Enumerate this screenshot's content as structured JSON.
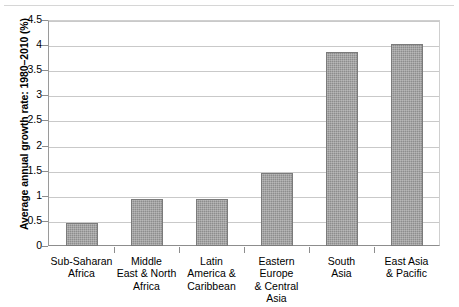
{
  "chart_data": {
    "type": "bar",
    "title": "",
    "subtitle": "",
    "xlabel": "",
    "ylabel": "Average annual growth rate: 1980–2010 (%)",
    "categories": [
      "Sub-Saharan\nAfrica",
      "Middle\nEast & North\nAfrica",
      "Latin\nAmerica &\nCaribbean",
      "Eastern\nEurope\n& Central\nAsia",
      "South\nAsia",
      "East Asia\n& Pacific"
    ],
    "values": [
      0.45,
      0.93,
      0.93,
      1.45,
      3.87,
      4.03
    ],
    "ylim": [
      0,
      4.5
    ],
    "ytick_labels": [
      "0",
      "0.5",
      "1",
      "1.5",
      "2",
      "2.5",
      "3",
      "3.5",
      "4",
      "4.5"
    ],
    "ytick_values": [
      0,
      0.5,
      1,
      1.5,
      2,
      2.5,
      3,
      3.5,
      4,
      4.5
    ],
    "grid": true,
    "legend": false,
    "legend_position": "none",
    "bar_color": "#8d8d8d",
    "bar_edge_color": "#7b7b7b",
    "gridline_color": "#c9c9c9",
    "axis_color": "#8d8d8d",
    "background_color": "#ffffff"
  }
}
